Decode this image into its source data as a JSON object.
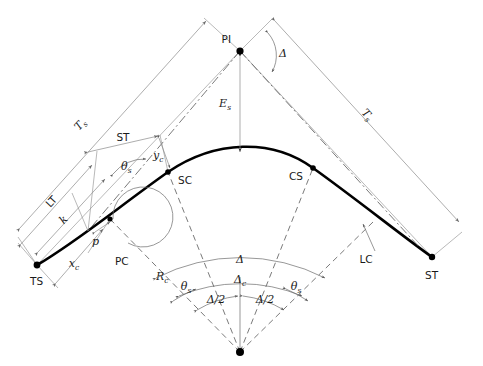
{
  "diagram": {
    "type": "engineering-geometry-diagram",
    "background_color": "#ffffff",
    "curve_color": "#000000",
    "dimension_color": "#8a8a8a",
    "dashed_color": "#4d4d4d"
  },
  "points": {
    "ts": {
      "label": "TS",
      "x": 37,
      "y": 265
    },
    "sc": {
      "label": "SC",
      "x": 168,
      "y": 172
    },
    "cs": {
      "label": "CS",
      "x": 313,
      "y": 168
    },
    "st": {
      "label": "ST",
      "x": 432,
      "y": 257
    },
    "pi": {
      "label": "PI",
      "x": 240,
      "y": 51
    },
    "pc": {
      "label": "PC",
      "x": 110,
      "y": 219
    },
    "center": {
      "label": "",
      "x": 240,
      "y": 352
    },
    "apex": {
      "label": "",
      "x": 240,
      "y": 154
    }
  },
  "labels": {
    "ts_point": "TS",
    "sc_point": "SC",
    "cs_point": "CS",
    "st_point": "ST",
    "pi_point": "PI",
    "pc_point": "PC",
    "tangent_left": "T",
    "tangent_left_sub": "s",
    "tangent_right": "T",
    "tangent_right_sub": "s",
    "short_tangent": "ST",
    "long_tangent": "LT",
    "long_chord": "LC",
    "external": "E",
    "external_sub": "s",
    "radius": "R",
    "radius_sub": "c",
    "offset_k": "k",
    "offset_p": "p",
    "x_c": "x",
    "x_c_sub": "c",
    "y_c": "y",
    "y_c_sub": "c",
    "theta_s_upper": "θ",
    "theta_s_upper_sub": "s",
    "theta_s_left": "θ",
    "theta_s_left_sub": "s",
    "theta_s_right": "θ",
    "theta_s_right_sub": "s",
    "delta_pi": "Δ",
    "delta_arc": "Δ",
    "delta_c": "Δ",
    "delta_c_sub": "c",
    "delta_half_left": "Δ/2",
    "delta_half_right": "Δ/2"
  },
  "annotations": [
    {
      "name": "tangent-left",
      "text": "Ts",
      "meaning": "total tangent distance from TS to PI"
    },
    {
      "name": "tangent-right",
      "text": "Ts",
      "meaning": "total tangent distance from PI to ST"
    },
    {
      "name": "short-tangent",
      "text": "ST",
      "meaning": "short tangent of the spiral"
    },
    {
      "name": "long-tangent",
      "text": "LT",
      "meaning": "long tangent of the spiral"
    },
    {
      "name": "long-chord",
      "text": "LC",
      "meaning": "long chord of the circular curve"
    },
    {
      "name": "external",
      "text": "Es",
      "meaning": "external distance PI to curve midpoint"
    },
    {
      "name": "radius",
      "text": "Rc",
      "meaning": "radius of circular curve"
    },
    {
      "name": "offset-k",
      "text": "k",
      "meaning": "spiral tangent offset abscissa"
    },
    {
      "name": "offset-p",
      "text": "p",
      "meaning": "spiral throw / offset"
    },
    {
      "name": "xc",
      "text": "xc",
      "meaning": "spiral abscissa at SC"
    },
    {
      "name": "yc",
      "text": "yc",
      "meaning": "spiral ordinate at SC"
    },
    {
      "name": "theta-s",
      "text": "θs",
      "meaning": "spiral angle"
    },
    {
      "name": "delta",
      "text": "Δ",
      "meaning": "total deflection angle"
    },
    {
      "name": "delta-c",
      "text": "Δc",
      "meaning": "central angle of circular curve"
    },
    {
      "name": "delta-half",
      "text": "Δ/2",
      "meaning": "half of total deflection angle"
    }
  ]
}
